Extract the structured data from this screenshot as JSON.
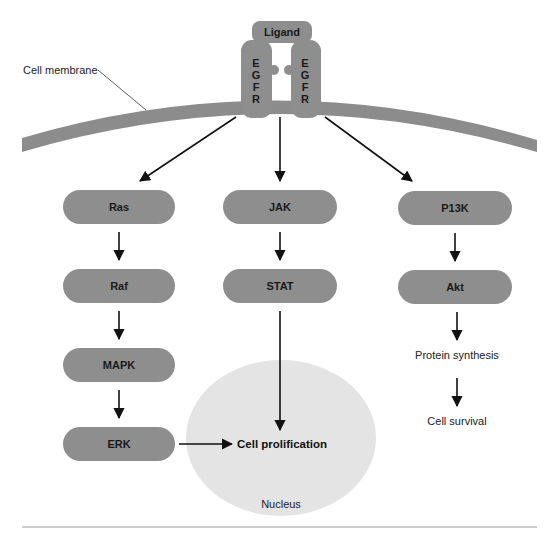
{
  "diagram": {
    "colors": {
      "membrane": "#8c8c8c",
      "pill": "#8e8e8e",
      "nucleus": "#e4e4e4",
      "arrow": "#111111",
      "rule": "#9a9a9a"
    },
    "labels": {
      "cell_membrane": "Cell membrane",
      "ligand": "Ligand",
      "receptor_left": [
        "E",
        "G",
        "F",
        "R"
      ],
      "receptor_right": [
        "E",
        "G",
        "F",
        "R"
      ],
      "nucleus": "Nucleus",
      "cell_proliferation": "Cell prolification",
      "protein_synthesis": "Protein synthesis",
      "cell_survival": "Cell survival"
    },
    "pathways": {
      "left": [
        "Ras",
        "Raf",
        "MAPK",
        "ERK"
      ],
      "center": [
        "JAK",
        "STAT"
      ],
      "right": [
        "P13K",
        "Akt"
      ]
    }
  }
}
